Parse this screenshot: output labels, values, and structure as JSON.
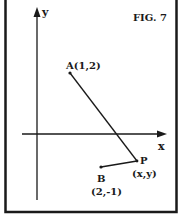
{
  "figure": {
    "title": "FIG. 7",
    "axes": {
      "x_label": "x",
      "y_label": "y"
    },
    "points": [
      {
        "name": "A",
        "label": "A(1,2)",
        "coords": [
          1,
          2
        ]
      },
      {
        "name": "B",
        "label": "B",
        "coord_label": "(2,-1)",
        "coords": [
          2,
          -1
        ]
      },
      {
        "name": "P",
        "label": "P",
        "coord_label": "(x,y)"
      }
    ],
    "segments": [
      {
        "from": "A",
        "to": "P"
      },
      {
        "from": "B",
        "to": "P"
      }
    ],
    "colors": {
      "ink": "#1a1a1a",
      "background": "#ffffff"
    }
  }
}
